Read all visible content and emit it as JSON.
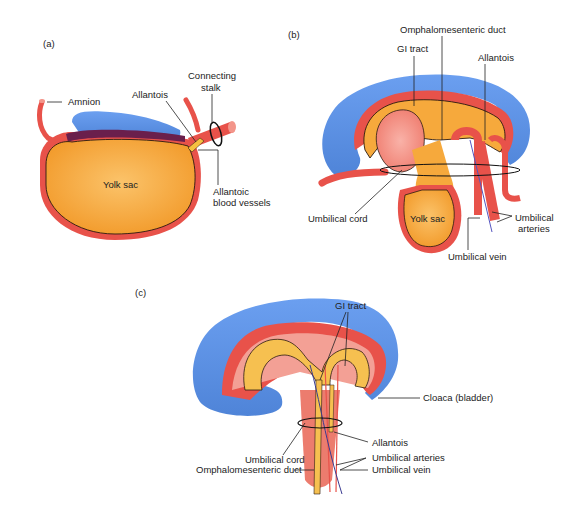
{
  "figure": {
    "colors": {
      "ectoderm_blue": "#5b8fe0",
      "mesoderm_red": "#e8524a",
      "tissue_pink": "#f3a095",
      "endoderm_orange": "#f6a93c",
      "yolk_orange": "#f7a535",
      "purple_layer": "#6a1f4c",
      "outline": "#2a1a10"
    }
  },
  "panels": [
    {
      "id": "a",
      "tag": "(a)",
      "labels": {
        "amnion": "Amnion",
        "allantois": "Allantois",
        "connecting_stalk_1": "Connecting",
        "connecting_stalk_2": "stalk",
        "yolk_sac": "Yolk sac",
        "allantoic_vessels_1": "Allantoic",
        "allantoic_vessels_2": "blood vessels"
      }
    },
    {
      "id": "b",
      "tag": "(b)",
      "labels": {
        "omphalomesenteric_duct": "Omphalomesenteric duct",
        "gi_tract": "GI tract",
        "allantois": "Allantois",
        "umbilical_cord": "Umbilical cord",
        "yolk_sac": "Yolk sac",
        "umbilical_arteries_1": "Umbilical",
        "umbilical_arteries_2": "arteries",
        "umbilical_vein": "Umbilical vein"
      }
    },
    {
      "id": "c",
      "tag": "(c)",
      "labels": {
        "gi_tract": "GI tract",
        "cloaca": "Cloaca (bladder)",
        "allantois": "Allantois",
        "umbilical_cord": "Umbilical cord",
        "umbilical_arteries": "Umbilical arteries",
        "omphalomesenteric_duct": "Omphalomesenteric duct",
        "umbilical_vein": "Umbilical vein"
      }
    }
  ]
}
